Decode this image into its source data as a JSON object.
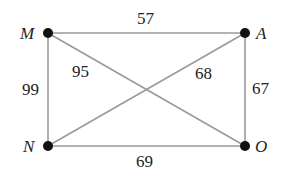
{
  "graph": {
    "vertices": [
      {
        "id": "M",
        "label": "M",
        "x": 48,
        "y": 33
      },
      {
        "id": "A",
        "label": "A",
        "x": 245,
        "y": 33
      },
      {
        "id": "N",
        "label": "N",
        "x": 48,
        "y": 146
      },
      {
        "id": "O",
        "label": "O",
        "x": 245,
        "y": 146
      }
    ],
    "edges": [
      {
        "from": "M",
        "to": "A",
        "weight": "57"
      },
      {
        "from": "M",
        "to": "N",
        "weight": "99"
      },
      {
        "from": "M",
        "to": "O",
        "weight": "95"
      },
      {
        "from": "N",
        "to": "A",
        "weight": "68"
      },
      {
        "from": "A",
        "to": "O",
        "weight": "67"
      },
      {
        "from": "N",
        "to": "O",
        "weight": "69"
      }
    ]
  },
  "colors": {
    "edge": "#9a9a9a",
    "node": "#111111",
    "text": "#222222"
  }
}
